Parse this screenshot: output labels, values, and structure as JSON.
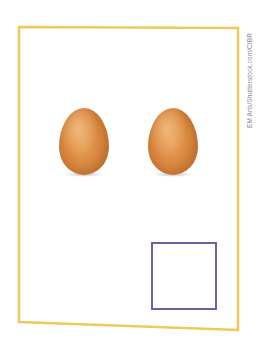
{
  "card": {
    "frame_color": "#f0c85a",
    "background": "#ffffff"
  },
  "objects": {
    "items": [
      {
        "type": "egg",
        "label": "egg",
        "color": "#d98a40"
      },
      {
        "type": "egg",
        "label": "egg",
        "color": "#d98a40"
      }
    ],
    "count_shown": 2
  },
  "answer_box": {
    "border_color": "#6b60a4",
    "value": ""
  },
  "credit": {
    "text": "EM Arts/Shutterstock.com/CIBR"
  }
}
